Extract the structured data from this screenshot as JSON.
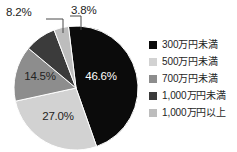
{
  "chart_data": {
    "type": "pie",
    "title": "",
    "subtitle": "",
    "xlabel": "",
    "ylabel": "",
    "grid": false,
    "legend_position": "right",
    "start_angle_deg": -7.0,
    "direction": "clockwise",
    "units": "%",
    "categories": [
      "300万円未満",
      "500万円未満",
      "700万円未満",
      "1,000万円未満",
      "1,000万円以上"
    ],
    "values": [
      46.6,
      27.0,
      14.5,
      8.2,
      3.8
    ],
    "data_labels": [
      "46.6%",
      "27.0%",
      "14.5%",
      "8.2%",
      "3.8%"
    ],
    "colors": [
      "#0b0b0b",
      "#d2d2d2",
      "#8d8d8d",
      "#3b3b3b",
      "#bdbdbd"
    ],
    "label_placement": [
      "inside",
      "inside",
      "inside",
      "callout",
      "callout"
    ],
    "slices": [
      {
        "label": "300万円未満",
        "value": 46.6,
        "display": "46.6%",
        "color": "#0b0b0b",
        "text_color": "#ffffff"
      },
      {
        "label": "500万円未満",
        "value": 27.0,
        "display": "27.0%",
        "color": "#d2d2d2",
        "text_color": "#232323"
      },
      {
        "label": "700万円未満",
        "value": 14.5,
        "display": "14.5%",
        "color": "#8d8d8d",
        "text_color": "#232323"
      },
      {
        "label": "1,000万円未満",
        "value": 8.2,
        "display": "8.2%",
        "color": "#3b3b3b",
        "text_color": "#232323"
      },
      {
        "label": "1,000万円以上",
        "value": 3.8,
        "display": "3.8%",
        "color": "#bdbdbd",
        "text_color": "#232323"
      }
    ]
  },
  "legend": {
    "items": [
      {
        "label": "300万円未満",
        "color": "#0b0b0b"
      },
      {
        "label": "500万円未満",
        "color": "#d2d2d2"
      },
      {
        "label": "700万円未満",
        "color": "#8d8d8d"
      },
      {
        "label": "1,000万円未満",
        "color": "#3b3b3b"
      },
      {
        "label": "1,000万円以上",
        "color": "#bdbdbd"
      }
    ]
  },
  "callouts": {
    "left": {
      "text": "8.2%"
    },
    "right": {
      "text": "3.8%"
    }
  },
  "theme": {
    "background": "#ffffff",
    "text": "#1e1e1e",
    "leader_line": "#4a4a4a"
  }
}
